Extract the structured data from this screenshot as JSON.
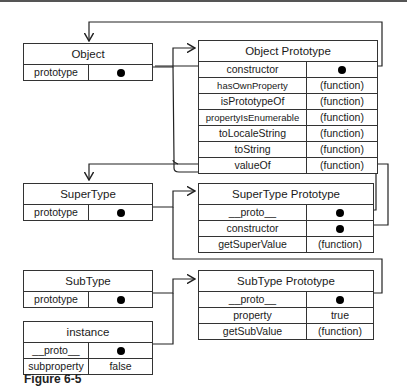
{
  "boxes": {
    "object": {
      "title": "Object",
      "rows": [
        {
          "key": "prototype",
          "value": ""
        }
      ]
    },
    "object_prototype": {
      "title": "Object Prototype",
      "rows": [
        {
          "key": "constructor",
          "value": ""
        },
        {
          "key": "hasOwnProperty",
          "value": "(function)"
        },
        {
          "key": "isPrototypeOf",
          "value": "(function)"
        },
        {
          "key": "propertyIsEnumerable",
          "value": "(function)"
        },
        {
          "key": "toLocaleString",
          "value": "(function)"
        },
        {
          "key": "toString",
          "value": "(function)"
        },
        {
          "key": "valueOf",
          "value": "(function)"
        }
      ]
    },
    "supertype": {
      "title": "SuperType",
      "rows": [
        {
          "key": "prototype",
          "value": ""
        }
      ]
    },
    "supertype_prototype": {
      "title": "SuperType Prototype",
      "rows": [
        {
          "key": "__proto__",
          "value": ""
        },
        {
          "key": "constructor",
          "value": ""
        },
        {
          "key": "getSuperValue",
          "value": "(function)"
        }
      ]
    },
    "subtype": {
      "title": "SubType",
      "rows": [
        {
          "key": "prototype",
          "value": ""
        }
      ]
    },
    "subtype_prototype": {
      "title": "SubType Prototype",
      "rows": [
        {
          "key": "__proto__",
          "value": ""
        },
        {
          "key": "property",
          "value": "true"
        },
        {
          "key": "getSubValue",
          "value": "(function)"
        }
      ]
    },
    "instance": {
      "title": "instance",
      "rows": [
        {
          "key": "__proto__",
          "value": ""
        },
        {
          "key": "subproperty",
          "value": "false"
        }
      ]
    }
  },
  "caption": "Figure 6-5"
}
